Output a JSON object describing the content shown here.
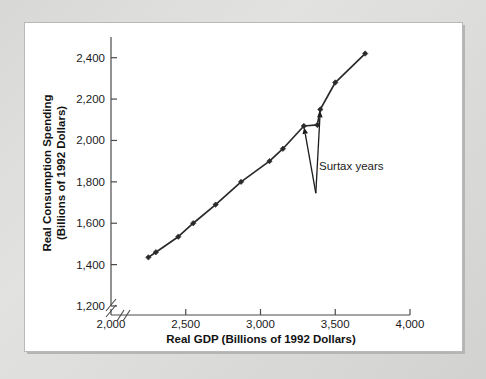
{
  "figure": {
    "background_color": "#ffffff",
    "mat_color": "#d8d8d6",
    "ink_color": "#2a2a2a"
  },
  "chart_data": {
    "type": "scatter",
    "title": "",
    "subtitle": "",
    "xlabel": "Real GDP (Billions of 1992 Dollars)",
    "ylabel": "Real Consumption Spending (Billions of 1992 Dollars)",
    "ylabel_line1": "Real Consumption Spending",
    "ylabel_line2": "(Billions of 1992 Dollars)",
    "xlim": [
      2000,
      4000
    ],
    "ylim": [
      1200,
      2500
    ],
    "xticks": [
      2000,
      2500,
      3000,
      3500,
      4000
    ],
    "xtick_labels": [
      "2,000",
      "2,500",
      "3,000",
      "3,500",
      "4,000"
    ],
    "yticks": [
      1200,
      1400,
      1600,
      1800,
      2000,
      2200,
      2400
    ],
    "ytick_labels": [
      "1,200",
      "1,400",
      "1,600",
      "1,800",
      "2,000",
      "2,200",
      "2,400"
    ],
    "grid": false,
    "legend": false,
    "axis_break": true,
    "axis_break_note": "slash break on both axes near origin",
    "marker": "filled-diamond",
    "line_connected": true,
    "series": [
      {
        "name": "Consumption function",
        "x": [
          2250,
          2300,
          2450,
          2550,
          2700,
          2870,
          3060,
          3150,
          3290,
          3380,
          3400,
          3500,
          3700
        ],
        "y": [
          1435,
          1460,
          1535,
          1600,
          1690,
          1800,
          1900,
          1960,
          2070,
          2075,
          2150,
          2280,
          2420
        ]
      }
    ],
    "annotations": [
      {
        "text": "Surtax years",
        "x": 3370,
        "y": 1745,
        "points_to": [
          {
            "x": 3290,
            "y": 2070
          },
          {
            "x": 3400,
            "y": 2150
          }
        ]
      }
    ]
  }
}
